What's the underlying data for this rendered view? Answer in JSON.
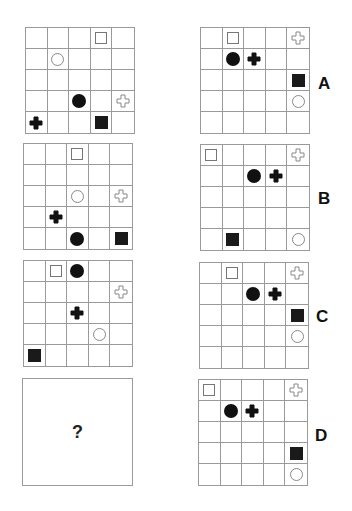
{
  "puzzle": {
    "sequence": [
      {
        "id": "seq-1",
        "shapes": [
          {
            "row": 0,
            "col": 3,
            "type": "open-square"
          },
          {
            "row": 1,
            "col": 1,
            "type": "open-circle"
          },
          {
            "row": 3,
            "col": 2,
            "type": "filled-circle"
          },
          {
            "row": 3,
            "col": 4,
            "type": "open-cross"
          },
          {
            "row": 4,
            "col": 0,
            "type": "filled-cross"
          },
          {
            "row": 4,
            "col": 3,
            "type": "filled-square"
          }
        ]
      },
      {
        "id": "seq-2",
        "shapes": [
          {
            "row": 0,
            "col": 2,
            "type": "open-square"
          },
          {
            "row": 2,
            "col": 2,
            "type": "open-circle"
          },
          {
            "row": 2,
            "col": 4,
            "type": "open-cross"
          },
          {
            "row": 3,
            "col": 1,
            "type": "filled-cross"
          },
          {
            "row": 4,
            "col": 2,
            "type": "filled-circle"
          },
          {
            "row": 4,
            "col": 4,
            "type": "filled-square"
          }
        ]
      },
      {
        "id": "seq-3",
        "shapes": [
          {
            "row": 0,
            "col": 1,
            "type": "open-square"
          },
          {
            "row": 0,
            "col": 2,
            "type": "filled-circle"
          },
          {
            "row": 1,
            "col": 4,
            "type": "open-cross"
          },
          {
            "row": 2,
            "col": 2,
            "type": "filled-cross"
          },
          {
            "row": 3,
            "col": 3,
            "type": "open-circle"
          },
          {
            "row": 4,
            "col": 0,
            "type": "filled-square"
          }
        ]
      }
    ],
    "question_mark": "?",
    "options": [
      {
        "label": "A",
        "shapes": [
          {
            "row": 0,
            "col": 1,
            "type": "open-square"
          },
          {
            "row": 0,
            "col": 4,
            "type": "open-cross"
          },
          {
            "row": 1,
            "col": 1,
            "type": "filled-circle"
          },
          {
            "row": 1,
            "col": 2,
            "type": "filled-cross"
          },
          {
            "row": 2,
            "col": 4,
            "type": "filled-square"
          },
          {
            "row": 3,
            "col": 4,
            "type": "open-circle"
          }
        ]
      },
      {
        "label": "B",
        "shapes": [
          {
            "row": 0,
            "col": 0,
            "type": "open-square"
          },
          {
            "row": 0,
            "col": 4,
            "type": "open-cross"
          },
          {
            "row": 1,
            "col": 2,
            "type": "filled-circle"
          },
          {
            "row": 1,
            "col": 3,
            "type": "filled-cross"
          },
          {
            "row": 4,
            "col": 1,
            "type": "filled-square"
          },
          {
            "row": 4,
            "col": 4,
            "type": "open-circle"
          }
        ]
      },
      {
        "label": "C",
        "shapes": [
          {
            "row": 0,
            "col": 1,
            "type": "open-square"
          },
          {
            "row": 0,
            "col": 4,
            "type": "open-cross"
          },
          {
            "row": 1,
            "col": 2,
            "type": "filled-circle"
          },
          {
            "row": 1,
            "col": 3,
            "type": "filled-cross"
          },
          {
            "row": 2,
            "col": 4,
            "type": "filled-square"
          },
          {
            "row": 3,
            "col": 4,
            "type": "open-circle"
          }
        ]
      },
      {
        "label": "D",
        "shapes": [
          {
            "row": 0,
            "col": 0,
            "type": "open-square"
          },
          {
            "row": 0,
            "col": 4,
            "type": "open-cross"
          },
          {
            "row": 1,
            "col": 1,
            "type": "filled-circle"
          },
          {
            "row": 1,
            "col": 2,
            "type": "filled-cross"
          },
          {
            "row": 3,
            "col": 4,
            "type": "filled-square"
          },
          {
            "row": 4,
            "col": 4,
            "type": "open-circle"
          }
        ]
      }
    ]
  }
}
